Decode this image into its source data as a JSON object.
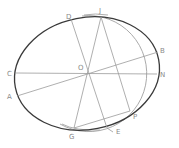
{
  "diagram": {
    "colors": {
      "ellipse": "#3a3a3a",
      "lines": "#9a9a9a",
      "arc": "#9a9a9a",
      "labels": "#8a8a8a"
    },
    "points": {
      "O": {
        "label": "O",
        "x": 87,
        "y": 73
      },
      "D": {
        "label": "D",
        "x": 71,
        "y": 19
      },
      "J": {
        "label": "J",
        "x": 101,
        "y": 17
      },
      "B": {
        "label": "B",
        "x": 158,
        "y": 52
      },
      "C": {
        "label": "C",
        "x": 16,
        "y": 73
      },
      "N": {
        "label": "N",
        "x": 157,
        "y": 74
      },
      "A": {
        "label": "A",
        "x": 17,
        "y": 96
      },
      "P": {
        "label": "P",
        "x": 130,
        "y": 111
      },
      "G": {
        "label": "G",
        "x": 74,
        "y": 128
      },
      "E": {
        "label": "E",
        "x": 107,
        "y": 128
      }
    },
    "label_positions": {
      "O": {
        "x": 78,
        "y": 70
      },
      "D": {
        "x": 66,
        "y": 19
      },
      "J": {
        "x": 99,
        "y": 13
      },
      "B": {
        "x": 160,
        "y": 53
      },
      "C": {
        "x": 7,
        "y": 76
      },
      "N": {
        "x": 160,
        "y": 77
      },
      "A": {
        "x": 7,
        "y": 99
      },
      "P": {
        "x": 133,
        "y": 119
      },
      "G": {
        "x": 69,
        "y": 139
      },
      "E": {
        "x": 117,
        "y": 134
      }
    },
    "segments": [
      [
        "C",
        "N"
      ],
      [
        "A",
        "B"
      ],
      [
        "D",
        "E"
      ],
      [
        "J",
        "G"
      ],
      [
        "J",
        "P"
      ],
      [
        "G",
        "P"
      ]
    ]
  }
}
